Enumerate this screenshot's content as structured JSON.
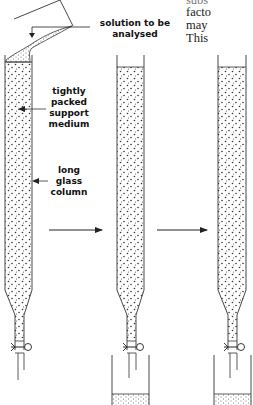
{
  "labels": {
    "solution": [
      "solution to be",
      "analysed"
    ],
    "medium": [
      "tightly",
      "packed",
      "support",
      "medium"
    ],
    "column": [
      "long",
      "glass",
      "column"
    ]
  },
  "body_text_fragments": [
    "subs",
    "facto",
    "may",
    "This"
  ],
  "colors": {
    "line": "#333333",
    "text": "#111111",
    "background": "#ffffff"
  },
  "diagram": {
    "stages": 3,
    "arrows": 2,
    "components": [
      "flask",
      "glass-column",
      "support-medium",
      "stopcock",
      "collecting-beaker"
    ]
  }
}
